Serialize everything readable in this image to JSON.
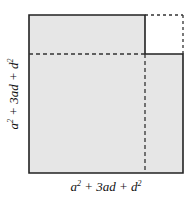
{
  "diagram": {
    "colors": {
      "fill": "#e6e6e6",
      "stroke": "#222222",
      "dashed": "#333333"
    },
    "labels": {
      "bottom": {
        "t1": "a",
        "e1": "2",
        "t2": " + 3ad + d",
        "e2": "2"
      },
      "left": {
        "t1": "a",
        "e1": "2",
        "t2": " + 3ad + d",
        "e2": "2"
      }
    }
  }
}
